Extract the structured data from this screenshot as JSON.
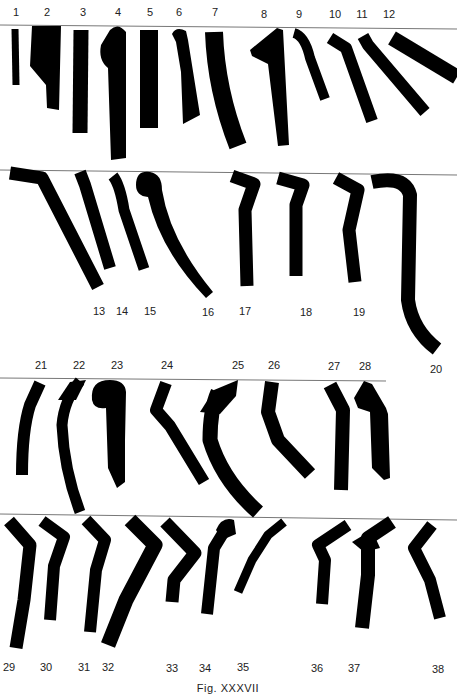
{
  "figure": {
    "caption": "Fig. XXXVII",
    "rows": [
      {
        "id": "row-1",
        "baseline_y": 26,
        "label_position": "above",
        "items": [
          {
            "n": "1",
            "lx": 16,
            "ly": 6
          },
          {
            "n": "2",
            "lx": 47,
            "ly": 6
          },
          {
            "n": "3",
            "lx": 83,
            "ly": 6
          },
          {
            "n": "4",
            "lx": 118,
            "ly": 6
          },
          {
            "n": "5",
            "lx": 150,
            "ly": 6
          },
          {
            "n": "6",
            "lx": 179,
            "ly": 6
          },
          {
            "n": "7",
            "lx": 215,
            "ly": 6
          },
          {
            "n": "8",
            "lx": 264,
            "ly": 8
          },
          {
            "n": "9",
            "lx": 299,
            "ly": 8
          },
          {
            "n": "10",
            "lx": 335,
            "ly": 8
          },
          {
            "n": "11",
            "lx": 362,
            "ly": 8
          },
          {
            "n": "12",
            "lx": 389,
            "ly": 8
          }
        ]
      },
      {
        "id": "row-2",
        "baseline_y": 172,
        "label_position": "below",
        "items": [
          {
            "n": "13",
            "lx": 99,
            "ly": 305
          },
          {
            "n": "14",
            "lx": 122,
            "ly": 305
          },
          {
            "n": "15",
            "lx": 150,
            "ly": 305
          },
          {
            "n": "16",
            "lx": 208,
            "ly": 306
          },
          {
            "n": "17",
            "lx": 245,
            "ly": 305
          },
          {
            "n": "18",
            "lx": 306,
            "ly": 306
          },
          {
            "n": "19",
            "lx": 359,
            "ly": 306
          },
          {
            "n": "20",
            "lx": 436,
            "ly": 363
          }
        ]
      },
      {
        "id": "row-3",
        "baseline_y": 379,
        "label_position": "above",
        "items": [
          {
            "n": "21",
            "lx": 41,
            "ly": 359
          },
          {
            "n": "22",
            "lx": 79,
            "ly": 359
          },
          {
            "n": "23",
            "lx": 117,
            "ly": 359
          },
          {
            "n": "24",
            "lx": 167,
            "ly": 359
          },
          {
            "n": "25",
            "lx": 238,
            "ly": 359
          },
          {
            "n": "26",
            "lx": 274,
            "ly": 359
          },
          {
            "n": "27",
            "lx": 334,
            "ly": 360
          },
          {
            "n": "28",
            "lx": 365,
            "ly": 360
          }
        ]
      },
      {
        "id": "row-4",
        "baseline_y": 515,
        "label_position": "below",
        "items": [
          {
            "n": "29",
            "lx": 9,
            "ly": 661
          },
          {
            "n": "30",
            "lx": 46,
            "ly": 661
          },
          {
            "n": "31",
            "lx": 84,
            "ly": 661
          },
          {
            "n": "32",
            "lx": 108,
            "ly": 661
          },
          {
            "n": "33",
            "lx": 172,
            "ly": 662
          },
          {
            "n": "34",
            "lx": 205,
            "ly": 662
          },
          {
            "n": "35",
            "lx": 243,
            "ly": 661
          },
          {
            "n": "36",
            "lx": 317,
            "ly": 662
          },
          {
            "n": "37",
            "lx": 354,
            "ly": 662
          },
          {
            "n": "38",
            "lx": 438,
            "ly": 663
          }
        ]
      }
    ]
  }
}
